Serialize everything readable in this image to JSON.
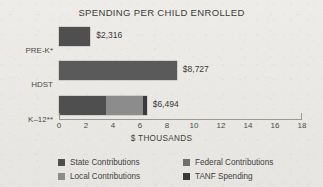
{
  "chart_data": {
    "type": "bar",
    "orientation": "horizontal",
    "stacked": true,
    "title": "SPENDING PER CHILD ENROLLED",
    "xlabel": "$ THOUSANDS",
    "ylabel": "",
    "xlim": [
      0,
      18
    ],
    "xticks": [
      0,
      2,
      4,
      6,
      8,
      10,
      12,
      14,
      16,
      18
    ],
    "xtick_labels": [
      "0",
      "2",
      "4",
      "6",
      "8",
      "10",
      "12",
      "14",
      "16",
      "18"
    ],
    "grid": false,
    "legend_position": "bottom",
    "categories": [
      "PRE-K*",
      "HDST",
      "K–12**"
    ],
    "series": [
      {
        "name": "State Contributions",
        "color": "#4f4f4f",
        "values": [
          2.316,
          0,
          3.45
        ]
      },
      {
        "name": "Federal Contributions",
        "color": "#6e6e6e",
        "values": [
          0,
          8.727,
          0
        ]
      },
      {
        "name": "Local Contributions",
        "color": "#8c8c8c",
        "values": [
          0,
          0,
          2.75
        ]
      },
      {
        "name": "TANF Spending",
        "color": "#3a3a3a",
        "values": [
          0,
          0,
          0.294
        ]
      }
    ],
    "bars": [
      {
        "category": "PRE-K*",
        "total": 2.316,
        "value_label": "$2,316",
        "segments": [
          {
            "series": "State Contributions",
            "value": 2.316,
            "color": "#4f4f4f"
          }
        ]
      },
      {
        "category": "HDST",
        "total": 8.727,
        "value_label": "$8,727",
        "segments": [
          {
            "series": "Federal Contributions",
            "value": 8.727,
            "color": "#5a5a5a"
          }
        ]
      },
      {
        "category": "K–12**",
        "total": 6.494,
        "value_label": "$6,494",
        "segments": [
          {
            "series": "State Contributions",
            "value": 3.45,
            "color": "#4f4f4f"
          },
          {
            "series": "Local Contributions",
            "value": 2.75,
            "color": "#8c8c8c"
          },
          {
            "series": "TANF Spending",
            "value": 0.294,
            "color": "#3a3a3a"
          }
        ]
      }
    ]
  },
  "legend": {
    "items": [
      {
        "label": "State Contributions",
        "color": "#4f4f4f"
      },
      {
        "label": "Federal Contributions",
        "color": "#6e6e6e"
      },
      {
        "label": "Local Contributions",
        "color": "#8c8c8c"
      },
      {
        "label": "TANF Spending",
        "color": "#3a3a3a"
      }
    ]
  },
  "colors": {
    "background": "#eceae6",
    "text": "#3a3a3a",
    "axis": "#9a9894"
  }
}
